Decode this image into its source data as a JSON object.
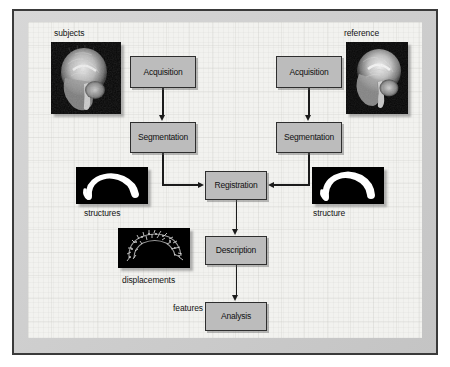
{
  "diagram": {
    "colors": {
      "node_fill": "#bcbcbc",
      "node_border": "#2e2e2e",
      "canvas_bg": "#f2f2ef",
      "frame_bg": "#c9c9c9",
      "frame_border": "#3a3a3a",
      "connector": "#1b1b1b",
      "thumb_bg": "#000000",
      "text": "#111111"
    },
    "nodes": [
      {
        "id": "acquisition-left",
        "label": "Acquisition",
        "column": "subject"
      },
      {
        "id": "segmentation-left",
        "label": "Segmentation",
        "column": "subject"
      },
      {
        "id": "acquisition-right",
        "label": "Acquisition",
        "column": "reference"
      },
      {
        "id": "segmentation-right",
        "label": "Segmentation",
        "column": "reference"
      },
      {
        "id": "registration",
        "label": "Registration",
        "column": "center"
      },
      {
        "id": "description",
        "label": "Description",
        "column": "center"
      },
      {
        "id": "analysis",
        "label": "Analysis",
        "column": "center"
      }
    ],
    "captions": [
      {
        "id": "subjects-label",
        "text": "subjects"
      },
      {
        "id": "reference-label",
        "text": "reference"
      },
      {
        "id": "structures-label",
        "text": "structures"
      },
      {
        "id": "structure-label",
        "text": "structure"
      },
      {
        "id": "displacements-label",
        "text": "displacements"
      },
      {
        "id": "features-label",
        "text": "features"
      }
    ],
    "thumbnails": [
      {
        "id": "subjects-mri",
        "kind": "mri-sagittal-head",
        "caption": "subjects"
      },
      {
        "id": "reference-mri",
        "kind": "mri-sagittal-head",
        "caption": "reference"
      },
      {
        "id": "structures-mask",
        "kind": "corpus-callosum-mask",
        "caption": "structures"
      },
      {
        "id": "structure-mask",
        "kind": "corpus-callosum-mask",
        "caption": "structure"
      },
      {
        "id": "displacements-field",
        "kind": "displacement-vectors",
        "caption": "displacements"
      }
    ],
    "edges": [
      {
        "from": "acquisition-left",
        "to": "segmentation-left",
        "direction": "down"
      },
      {
        "from": "acquisition-right",
        "to": "segmentation-right",
        "direction": "down"
      },
      {
        "from": "segmentation-left",
        "to": "registration",
        "direction": "down-right"
      },
      {
        "from": "segmentation-right",
        "to": "registration",
        "direction": "down-left"
      },
      {
        "from": "registration",
        "to": "description",
        "direction": "down"
      },
      {
        "from": "description",
        "to": "analysis",
        "direction": "down",
        "label": "features"
      }
    ]
  }
}
